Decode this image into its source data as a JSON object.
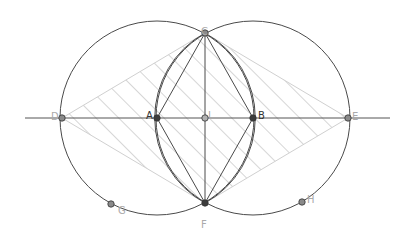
{
  "diagram": {
    "colors": {
      "stroke": "#4a4a4a",
      "light_stroke": "#c8c8c8",
      "hatch": "#c4c4c4",
      "point_dark": "#3c3c3c",
      "point_light": "#8a8a8a",
      "label_dark": "#333333",
      "label_light": "#aaaaaa"
    },
    "line": {
      "x1": 25,
      "y1": 118,
      "x2": 390,
      "y2": 118
    },
    "circles": [
      {
        "name": "circle-A",
        "cx": 157,
        "cy": 118,
        "r": 97
      },
      {
        "name": "circle-B",
        "cx": 253,
        "cy": 118,
        "r": 97
      }
    ],
    "points": [
      {
        "id": "A",
        "label": "A",
        "x": 157,
        "y": 118,
        "lx": 146,
        "ly": 111,
        "style": "dark"
      },
      {
        "id": "B",
        "label": "B",
        "x": 253,
        "y": 118,
        "lx": 258,
        "ly": 111,
        "style": "dark"
      },
      {
        "id": "L",
        "label": "L",
        "x": 205,
        "y": 118,
        "lx": 208,
        "ly": 111,
        "style": "light"
      },
      {
        "id": "C",
        "label": "C",
        "x": 205,
        "y": 33,
        "lx": 201,
        "ly": 27,
        "style": "mid"
      },
      {
        "id": "F",
        "label": "F",
        "x": 205,
        "y": 203,
        "lx": 201,
        "ly": 220,
        "style": "dark"
      },
      {
        "id": "D",
        "label": "D",
        "x": 62,
        "y": 118,
        "lx": 51,
        "ly": 112,
        "style": "mid"
      },
      {
        "id": "E",
        "label": "E",
        "x": 348,
        "y": 118,
        "lx": 352,
        "ly": 112,
        "style": "mid"
      },
      {
        "id": "G",
        "label": "G",
        "x": 111,
        "y": 204,
        "lx": 118,
        "ly": 206,
        "style": "mid"
      },
      {
        "id": "H",
        "label": "H",
        "x": 302,
        "y": 202,
        "lx": 307,
        "ly": 195,
        "style": "mid"
      }
    ]
  }
}
